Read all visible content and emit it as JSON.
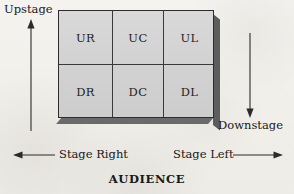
{
  "diagram": {
    "background_color": "#f3f1ed",
    "stage": {
      "fill_color": "#d4d4d4",
      "border_color": "#2c2c2c",
      "shadow_color": "#5d5d5d",
      "rows": 2,
      "columns": 3,
      "cells": [
        {
          "id": "UR",
          "label": "UR",
          "row": 0,
          "column": 0,
          "meaning": "Upstage Right"
        },
        {
          "id": "UC",
          "label": "UC",
          "row": 0,
          "column": 1,
          "meaning": "Upstage Center"
        },
        {
          "id": "UL",
          "label": "UL",
          "row": 0,
          "column": 2,
          "meaning": "Upstage Left"
        },
        {
          "id": "DR",
          "label": "DR",
          "row": 1,
          "column": 0,
          "meaning": "Downstage Right"
        },
        {
          "id": "DC",
          "label": "DC",
          "row": 1,
          "column": 1,
          "meaning": "Downstage Center"
        },
        {
          "id": "DL",
          "label": "DL",
          "row": 1,
          "column": 2,
          "meaning": "Downstage Left"
        }
      ]
    },
    "annotations": {
      "upstage": {
        "label": "Upstage",
        "arrow_direction": "up"
      },
      "downstage": {
        "label": "Downstage",
        "arrow_direction": "down"
      },
      "stage_right": {
        "label": "Stage Right",
        "arrow_direction": "left"
      },
      "stage_left": {
        "label": "Stage Left",
        "arrow_direction": "right"
      },
      "audience": {
        "label": "AUDIENCE"
      }
    }
  }
}
